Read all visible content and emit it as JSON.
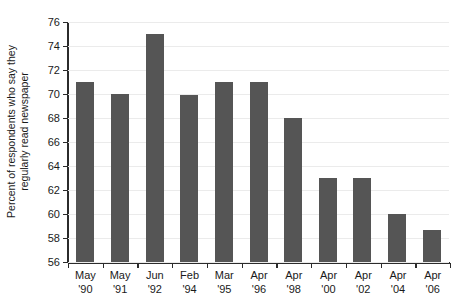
{
  "chart_data": {
    "type": "bar",
    "title": "",
    "subtitle": "",
    "xlabel": "",
    "ylabel": "Percent of respondents who say they regularly read newspaper",
    "ylabel_line1": "Percent of respondents who say they",
    "ylabel_line2": "regularly read newspaper",
    "categories": [
      "May '90",
      "May '91",
      "Jun '92",
      "Feb '94",
      "Mar '95",
      "Apr '96",
      "Apr '98",
      "Apr '00",
      "Apr '02",
      "Apr '04",
      "Apr '06"
    ],
    "category_lines": [
      {
        "month": "May",
        "year": "'90"
      },
      {
        "month": "May",
        "year": "'91"
      },
      {
        "month": "Jun",
        "year": "'92"
      },
      {
        "month": "Feb",
        "year": "'94"
      },
      {
        "month": "Mar",
        "year": "'95"
      },
      {
        "month": "Apr",
        "year": "'96"
      },
      {
        "month": "Apr",
        "year": "'98"
      },
      {
        "month": "Apr",
        "year": "'00"
      },
      {
        "month": "Apr",
        "year": "'02"
      },
      {
        "month": "Apr",
        "year": "'04"
      },
      {
        "month": "Apr",
        "year": "'06"
      }
    ],
    "values": [
      71,
      70,
      75,
      69.9,
      71,
      71,
      68,
      63,
      63,
      60,
      58.7
    ],
    "ylim": [
      56,
      76
    ],
    "yticks": [
      56,
      58,
      60,
      62,
      64,
      66,
      68,
      70,
      72,
      74,
      76
    ],
    "ytick_labels": [
      "56",
      "58",
      "60",
      "62",
      "64",
      "66",
      "68",
      "70",
      "72",
      "74",
      "76"
    ],
    "grid": true,
    "grid_axis": "y",
    "legend": false,
    "legend_position": "none",
    "bar_color": "#555555",
    "grid_color": "#ebebeb",
    "axis_color": "#2b2b2b",
    "background_color": "#ffffff"
  }
}
